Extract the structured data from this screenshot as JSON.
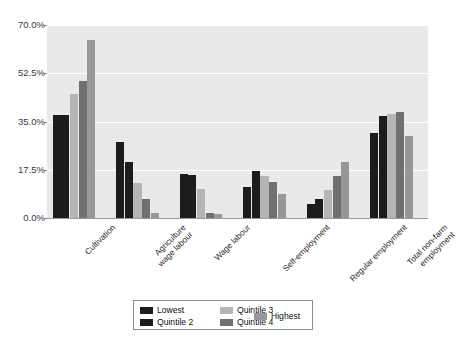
{
  "chart_data": {
    "type": "bar",
    "title": "",
    "subtitle": "",
    "xlabel": "",
    "ylabel": "",
    "ylim": [
      0,
      70
    ],
    "ytick_labels": [
      "0.0%",
      "17.5%",
      "35.0%",
      "52.5%",
      "70.0%"
    ],
    "ytick_values": [
      0,
      17.5,
      35.0,
      52.5,
      70.0
    ],
    "grid": true,
    "legend_position": "bottom",
    "categories": [
      "Cultivation",
      "Agriculture\nwage labour",
      "Wage labour",
      "Self-employment",
      "Regular employment",
      "Total non-farm\nemployment"
    ],
    "series": [
      {
        "name": "Lowest",
        "color": "#1c1c1c",
        "values": [
          37.2,
          27.6,
          16.0,
          11.4,
          5.2,
          31.0
        ]
      },
      {
        "name": "Quintile 2",
        "color": "#1c1c1c",
        "values": [
          37.2,
          20.2,
          15.7,
          17.1,
          6.9,
          37.0
        ]
      },
      {
        "name": "Quintile 3",
        "color": "#b5b5b5",
        "values": [
          44.8,
          12.6,
          10.4,
          15.2,
          10.1,
          37.6
        ]
      },
      {
        "name": "Quintile 4",
        "color": "#707070",
        "values": [
          49.8,
          7.0,
          2.0,
          13.2,
          15.1,
          38.3
        ]
      },
      {
        "name": "Highest",
        "color": "#979797",
        "values": [
          64.6,
          1.8,
          1.5,
          8.6,
          20.3,
          29.6
        ]
      }
    ]
  },
  "legend": {
    "entries": [
      {
        "label": "Lowest"
      },
      {
        "label": "Quintile 2"
      },
      {
        "label": "Quintile 3"
      },
      {
        "label": "Quintile 4"
      },
      {
        "label": "Highest"
      }
    ]
  },
  "colors": {
    "plot_background": "#e9e9e9",
    "page_background": "#ffffff",
    "gridline": "#ffffff",
    "axis": "#9a9a9a",
    "text": "#2b2b2b"
  }
}
